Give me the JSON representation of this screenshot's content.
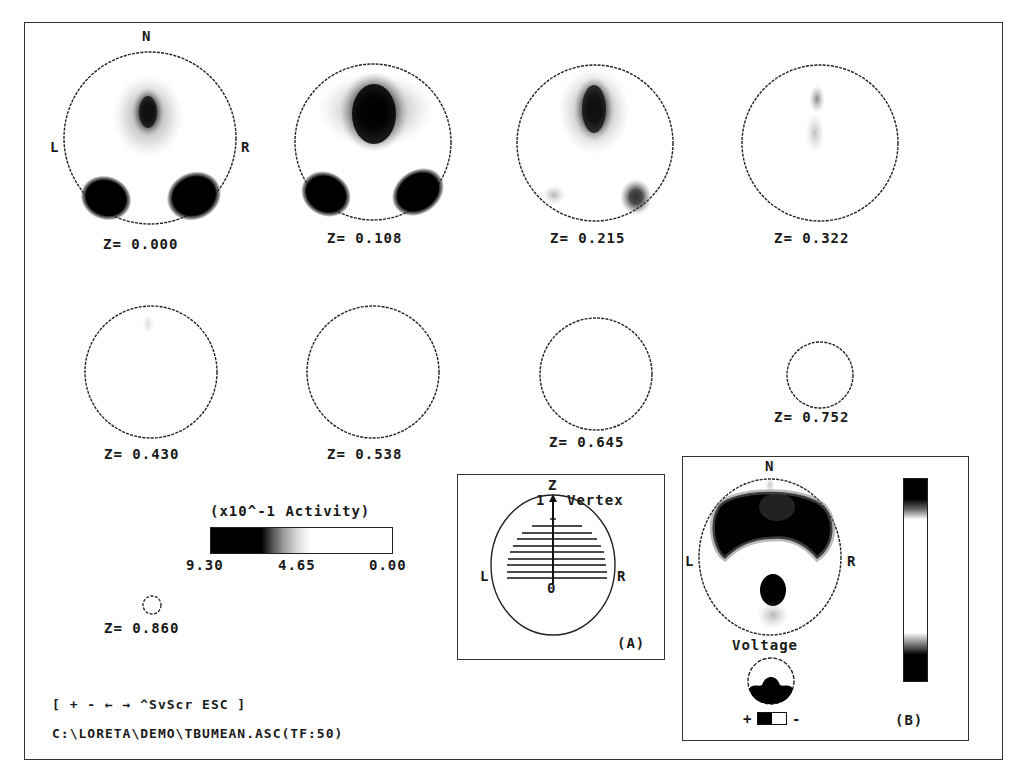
{
  "window": {
    "program": "LORETA",
    "file_path": "C:\\LORETA\\DEMO\\TBUMEAN.ASC(TF:50)",
    "key_help": "[ + - ← → ^SvScr ESC ]"
  },
  "orientation": {
    "north": "N",
    "left": "L",
    "right": "R"
  },
  "slices": [
    {
      "label": "Z= 0.000",
      "z": 0.0
    },
    {
      "label": "Z= 0.108",
      "z": 0.108
    },
    {
      "label": "Z= 0.215",
      "z": 0.215
    },
    {
      "label": "Z= 0.322",
      "z": 0.322
    },
    {
      "label": "Z= 0.430",
      "z": 0.43
    },
    {
      "label": "Z= 0.538",
      "z": 0.538
    },
    {
      "label": "Z= 0.645",
      "z": 0.645
    },
    {
      "label": "Z= 0.752",
      "z": 0.752
    },
    {
      "label": "Z= 0.860",
      "z": 0.86
    }
  ],
  "activity_scale": {
    "title": "(x10^-1 Activity)",
    "max": "9.30",
    "mid": "4.65",
    "min": "0.00",
    "colors": {
      "high": "#000000",
      "low": "#ffffff"
    }
  },
  "panel_a": {
    "axis_label": "Z",
    "top_value": "1",
    "vertex_label": "Vertex",
    "origin_value": "0",
    "left": "L",
    "right": "R",
    "caption": "(A)"
  },
  "panel_b": {
    "north": "N",
    "left": "L",
    "right": "R",
    "voltage_label": "Voltage",
    "plus": "+",
    "minus": "-",
    "caption": "(B)"
  },
  "colors": {
    "ink": "#111111",
    "background": "#ffffff",
    "frame": "#333333"
  }
}
